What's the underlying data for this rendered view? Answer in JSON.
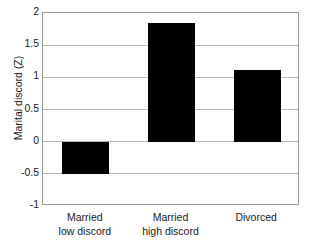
{
  "chart_data": {
    "type": "bar",
    "title": "",
    "xlabel": "",
    "ylabel": "Marital discord (Z)",
    "categories": [
      "Married low discord",
      "Married high discord",
      "Divorced"
    ],
    "category_lines": [
      [
        "Married",
        "low discord"
      ],
      [
        "Married",
        "high discord"
      ],
      [
        "Divorced",
        ""
      ]
    ],
    "values": [
      -0.5,
      1.85,
      1.12
    ],
    "ylim": [
      -1,
      2
    ],
    "yticks": [
      2,
      1.5,
      1,
      0.5,
      0,
      -0.5,
      -1
    ],
    "ytick_labels": [
      "2",
      "1.5",
      "1",
      "0.5",
      "0",
      "-0.5",
      "-1"
    ],
    "grid": true,
    "legend": "none",
    "bar_color": "#000000",
    "grid_color": "#b5b5b5",
    "axis_color": "#9a9a9a"
  }
}
